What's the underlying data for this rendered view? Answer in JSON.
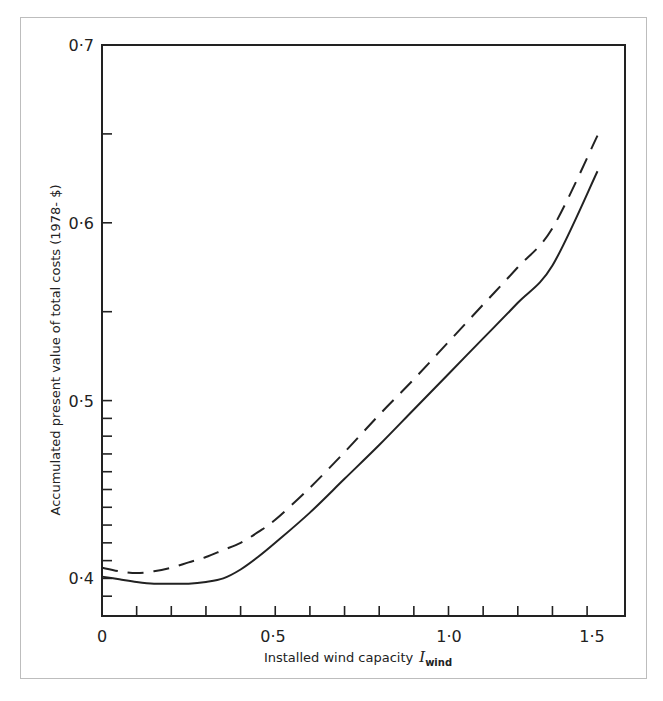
{
  "chart_data": {
    "type": "line",
    "title": "",
    "xlabel": "Installed wind capacity",
    "xlabel_symbol": "I",
    "xlabel_subscript": "wind",
    "ylabel": "Accumulated present value of total costs (1978- $)",
    "xlim": [
      0,
      1.5
    ],
    "ylim": [
      0.38,
      0.7
    ],
    "x_ticks_major": [
      0,
      0.5,
      1.0,
      1.5
    ],
    "x_tick_labels": [
      "0",
      "0·5",
      "1·0",
      "1·5"
    ],
    "y_ticks_major": [
      0.4,
      0.5,
      0.6,
      0.7
    ],
    "y_tick_labels": [
      "0·4",
      "0·5",
      "0·6",
      "0·7"
    ],
    "grid": false,
    "legend": null,
    "series": [
      {
        "name": "solid",
        "style": "solid",
        "x": [
          0,
          0.05,
          0.1,
          0.15,
          0.2,
          0.25,
          0.3,
          0.35,
          0.4,
          0.45,
          0.5,
          0.6,
          0.7,
          0.8,
          0.9,
          1.0,
          1.1,
          1.2,
          1.3,
          1.43
        ],
        "y": [
          0.401,
          0.3995,
          0.398,
          0.397,
          0.397,
          0.397,
          0.398,
          0.4,
          0.405,
          0.412,
          0.42,
          0.437,
          0.456,
          0.475,
          0.495,
          0.515,
          0.535,
          0.555,
          0.576,
          0.629
        ]
      },
      {
        "name": "dashed",
        "style": "dashed",
        "x": [
          0,
          0.05,
          0.1,
          0.15,
          0.2,
          0.25,
          0.3,
          0.35,
          0.4,
          0.45,
          0.5,
          0.6,
          0.7,
          0.8,
          0.9,
          1.0,
          1.1,
          1.2,
          1.3,
          1.43
        ],
        "y": [
          0.406,
          0.404,
          0.403,
          0.404,
          0.406,
          0.409,
          0.412,
          0.416,
          0.42,
          0.426,
          0.433,
          0.451,
          0.471,
          0.492,
          0.512,
          0.533,
          0.554,
          0.575,
          0.597,
          0.649
        ]
      }
    ]
  },
  "colors": {
    "line": "#222222",
    "frame": "#bdbdbd",
    "background": "#ffffff"
  }
}
